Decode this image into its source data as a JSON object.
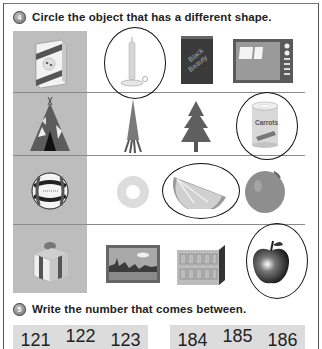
{
  "question4": {
    "number": "4",
    "instruction": "Circle the object that has a different shape.",
    "rows": [
      {
        "reference": {
          "name": "cereal-box",
          "label": "Cheerios"
        },
        "options": [
          {
            "name": "candle",
            "circled": true
          },
          {
            "name": "book",
            "label": "Black Beauty",
            "circled": false
          },
          {
            "name": "television",
            "circled": false
          }
        ]
      },
      {
        "reference": {
          "name": "teepee"
        },
        "options": [
          {
            "name": "carrot",
            "circled": false
          },
          {
            "name": "pine-tree",
            "circled": false
          },
          {
            "name": "can-of-carrots",
            "label": "Carrots",
            "circled": true
          }
        ]
      },
      {
        "reference": {
          "name": "volleyball"
        },
        "options": [
          {
            "name": "pineapple-ring",
            "circled": false
          },
          {
            "name": "orange-slice",
            "circled": true
          },
          {
            "name": "orange",
            "circled": false
          }
        ]
      },
      {
        "reference": {
          "name": "gift-box"
        },
        "options": [
          {
            "name": "framed-picture",
            "circled": false
          },
          {
            "name": "building-block",
            "circled": false
          },
          {
            "name": "apple",
            "circled": true
          }
        ]
      }
    ]
  },
  "question5": {
    "number": "5",
    "instruction": "Write the number that comes between.",
    "groups": [
      {
        "numbers": [
          "121",
          "122",
          "123"
        ]
      },
      {
        "numbers": [
          "184",
          "185",
          "186"
        ]
      }
    ]
  },
  "colors": {
    "gray_column": "#bdbdbd",
    "number_strip": "#dcdcdc",
    "circle_stroke": "#111111"
  }
}
